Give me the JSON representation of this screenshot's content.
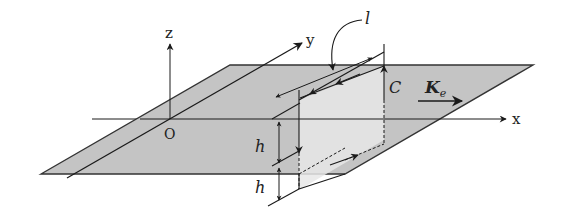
{
  "figure": {
    "axes": {
      "x_label": "x",
      "y_label": "y",
      "z_label": "z",
      "origin_label": "O"
    },
    "labels": {
      "loop": "C",
      "length": "l",
      "height_upper": "h",
      "height_lower": "h",
      "current_main": "K",
      "current_sub": "e"
    },
    "colors": {
      "sheet_fill": "#c4c4c4",
      "loop_face": "#e6e6e6",
      "line": "#1a1a1a",
      "background": "#ffffff"
    }
  }
}
